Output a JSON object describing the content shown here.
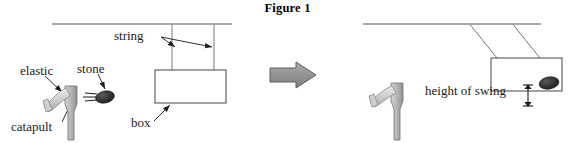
{
  "figure": {
    "title": "Figure 1",
    "caption_position": "top-center"
  },
  "colors": {
    "ink": "#1a1a1a",
    "line": "#555555",
    "ceiling": "#555555",
    "box_outline": "#555555",
    "catapult_gray": "#b3b3b3",
    "catapult_light": "#d8d8d8",
    "catapult_shade": "#999999",
    "stone_dark": "#2b2b2b",
    "arrow_gray": "#8c8c8c",
    "arrow_gray_edge": "#5a5a5a",
    "background": "#ffffff"
  },
  "left_panel": {
    "name": "before-impact",
    "labels": {
      "elastic": "elastic",
      "stone": "stone",
      "catapult": "catapult",
      "string": "string",
      "box": "box"
    },
    "ceiling": {
      "x1": 52,
      "y1": 24,
      "x2": 232,
      "y2": 24
    },
    "strings": [
      {
        "x1": 172,
        "y1": 24,
        "x2": 172,
        "y2": 70
      },
      {
        "x1": 214,
        "y1": 24,
        "x2": 214,
        "y2": 70
      }
    ],
    "box": {
      "x": 155,
      "y": 70,
      "width": 71,
      "height": 33
    },
    "catapult": {
      "post_x": 70,
      "post_top": 86,
      "post_bottom": 140
    },
    "stone": {
      "cx": 105,
      "cy": 97,
      "rx": 9,
      "ry": 5.5
    }
  },
  "transition": {
    "name": "process-arrow",
    "direction": "right",
    "x": 270,
    "y": 62,
    "width": 46,
    "height": 26
  },
  "right_panel": {
    "name": "after-impact",
    "labels": {
      "height_of_swing": "height of swing"
    },
    "ceiling": {
      "x1": 363,
      "y1": 24,
      "x2": 541,
      "y2": 24
    },
    "strings": [
      {
        "x1": 470,
        "y1": 24,
        "x2": 496,
        "y2": 62
      },
      {
        "x1": 513,
        "y1": 24,
        "x2": 539,
        "y2": 62
      },
      {
        "x1": 470,
        "y1": 24,
        "x2": 496,
        "y2": 62
      }
    ],
    "box": {
      "x": 491,
      "y": 58,
      "width": 71,
      "height": 33
    },
    "catapult": {
      "post_x": 396,
      "post_top": 83,
      "post_bottom": 140
    },
    "stone": {
      "cx": 549,
      "cy": 84,
      "rx": 9,
      "ry": 5.5
    },
    "measure_arrow": {
      "x": 528,
      "y_top": 85,
      "y_bottom": 106
    }
  }
}
